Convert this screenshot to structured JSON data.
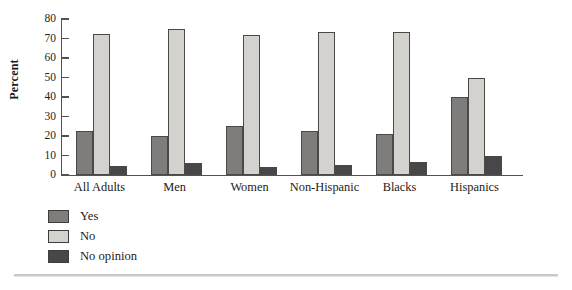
{
  "chart_data": {
    "type": "bar",
    "title": "",
    "xlabel": "",
    "ylabel": "Percent",
    "ylim": [
      0,
      80
    ],
    "yticks": [
      0,
      10,
      20,
      30,
      40,
      50,
      60,
      70,
      80
    ],
    "grid": false,
    "legend_position": "bottom-left",
    "categories": [
      "All Adults",
      "Men",
      "Women",
      "Non-Hispanic",
      "Blacks",
      "Hispanics"
    ],
    "series": [
      {
        "name": "Yes",
        "color": "#7e7d7c",
        "values": [
          22.5,
          20.0,
          25.0,
          22.5,
          21.0,
          40.0
        ]
      },
      {
        "name": "No",
        "color": "#d3d2ce",
        "values": [
          72.5,
          75.0,
          72.0,
          73.5,
          73.5,
          50.0
        ]
      },
      {
        "name": "No opinion",
        "color": "#47474a",
        "values": [
          4.5,
          6.0,
          4.0,
          5.0,
          6.5,
          10.0
        ]
      }
    ]
  },
  "axis": {
    "y_title": "Percent"
  },
  "legend": {
    "items": [
      {
        "label": "Yes"
      },
      {
        "label": "No"
      },
      {
        "label": "No opinion"
      }
    ]
  }
}
